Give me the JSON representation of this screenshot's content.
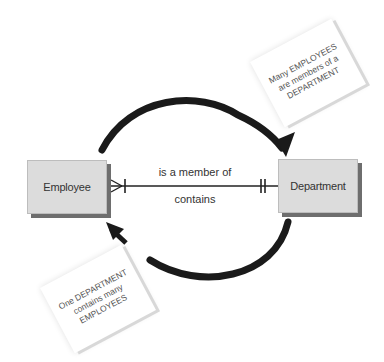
{
  "diagram": {
    "type": "entity-relationship",
    "entities": [
      {
        "name": "Employee"
      },
      {
        "name": "Department"
      }
    ],
    "relationship": {
      "forward_label": "is a member of",
      "reverse_label": "contains",
      "employee_end": "many (crow's foot) with one bar",
      "department_end": "one and only one (double bar)"
    },
    "notes": {
      "top_right": "Many EMPLOYEES\nare members of a\nDEPARTMENT",
      "bottom_left": "One DEPARTMENT\ncontains many\nEMPLOYEES"
    },
    "arrows": {
      "top": "Employee to Department",
      "bottom": "Department to Employee"
    },
    "colors": {
      "entity_fill": "#dcdcdc",
      "entity_shadow": "#6e6e6e",
      "line": "#222222",
      "text": "#333333"
    }
  }
}
